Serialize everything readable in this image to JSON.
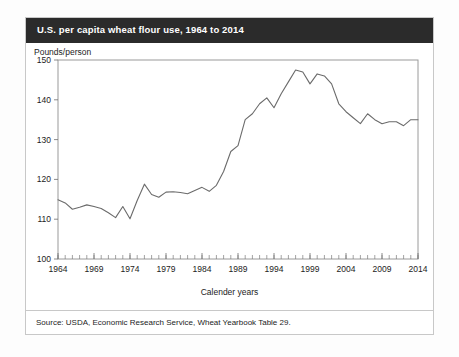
{
  "card": {
    "title": "U.S. per capita wheat flour use, 1964 to 2014",
    "source": "Source: USDA, Economic Research Service, Wheat Yearbook Table 29."
  },
  "chart_data": {
    "type": "line",
    "title": "U.S. per capita wheat flour use, 1964 to 2014",
    "xlabel": "Calender years",
    "ylabel": "Pounds/person",
    "xlim": [
      1964,
      2014
    ],
    "ylim": [
      100,
      150
    ],
    "yticks": [
      100,
      110,
      120,
      130,
      140,
      150
    ],
    "xticks": [
      1964,
      1969,
      1974,
      1979,
      1984,
      1989,
      1994,
      1999,
      2004,
      2009,
      2014
    ],
    "xtick_minor_step": 1,
    "grid": false,
    "legend": null,
    "line_color": "#6b6b6b",
    "series": [
      {
        "name": "Wheat flour use per capita",
        "x": [
          1964,
          1965,
          1966,
          1967,
          1968,
          1969,
          1970,
          1971,
          1972,
          1973,
          1974,
          1975,
          1976,
          1977,
          1978,
          1979,
          1980,
          1981,
          1982,
          1983,
          1984,
          1985,
          1986,
          1987,
          1988,
          1989,
          1990,
          1991,
          1992,
          1993,
          1994,
          1995,
          1996,
          1997,
          1998,
          1999,
          2000,
          2001,
          2002,
          2003,
          2004,
          2005,
          2006,
          2007,
          2008,
          2009,
          2010,
          2011,
          2012,
          2013,
          2014
        ],
        "values": [
          114.9,
          114.1,
          112.5,
          113.0,
          113.6,
          113.2,
          112.7,
          111.6,
          110.4,
          113.2,
          110.1,
          114.7,
          118.8,
          116.2,
          115.5,
          116.8,
          116.9,
          116.7,
          116.4,
          117.2,
          118.0,
          117.0,
          118.5,
          122.0,
          127.0,
          128.5,
          135.0,
          136.5,
          139.0,
          140.5,
          138.0,
          141.5,
          144.5,
          147.5,
          147.0,
          144.0,
          146.5,
          146.0,
          144.0,
          139.0,
          137.0,
          135.5,
          134.0,
          136.5,
          135.0,
          134.0,
          134.5,
          134.5,
          133.5,
          135.0,
          135.0
        ]
      }
    ]
  }
}
